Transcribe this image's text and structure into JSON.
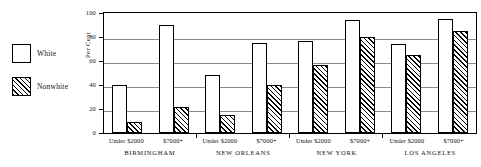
{
  "chart_data": {
    "type": "bar",
    "title": "",
    "xlabel": "",
    "ylabel": "Per Cent",
    "ylim": [
      0,
      100
    ],
    "yticks": [
      100,
      80,
      60,
      40,
      20,
      0
    ],
    "grid": true,
    "legend_position": "left",
    "groups": [
      "BIRMINGHAM",
      "NEW ORLEANS",
      "NEW YORK",
      "LOS ANGELES"
    ],
    "bins": [
      "Under $2000",
      "$7000+"
    ],
    "categories": [
      "BIRMINGHAM Under $2000",
      "BIRMINGHAM $7000+",
      "NEW ORLEANS Under $2000",
      "NEW ORLEANS $7000+",
      "NEW YORK Under $2000",
      "NEW YORK $7000+",
      "LOS ANGELES Under $2000",
      "LOS ANGELES $7000+"
    ],
    "series": [
      {
        "name": "White",
        "fill": "empty",
        "values": [
          40,
          90,
          48,
          75,
          77,
          94,
          74,
          95
        ]
      },
      {
        "name": "Nonwhite",
        "fill": "diagonal-hatch",
        "values": [
          9,
          22,
          15,
          40,
          57,
          80,
          65,
          85
        ]
      }
    ],
    "colors": {
      "outline": "#000000",
      "white_fill": "#ffffff",
      "nonwhite_fill": "#ffffff",
      "hatch": "#000000",
      "gridline": "#8a8a8a"
    }
  },
  "legend": {
    "items": [
      {
        "label": "White",
        "swatch": "empty-box"
      },
      {
        "label": "Nonwhite",
        "swatch": "hatched-box"
      }
    ]
  },
  "axis": {
    "y_title": "Per Cent",
    "y_ticks": [
      "100",
      "80",
      "60",
      "40",
      "20",
      "0"
    ]
  },
  "xaxis": {
    "groups": [
      {
        "city": "BIRMINGHAM",
        "bins": [
          "Under $2000",
          "$7000+"
        ]
      },
      {
        "city": "NEW ORLEANS",
        "bins": [
          "Under $2000",
          "$7000+"
        ]
      },
      {
        "city": "NEW YORK",
        "bins": [
          "Under $2000",
          "$7000+"
        ]
      },
      {
        "city": "LOS ANGELES",
        "bins": [
          "Under $2000",
          "$7000+"
        ]
      }
    ]
  }
}
